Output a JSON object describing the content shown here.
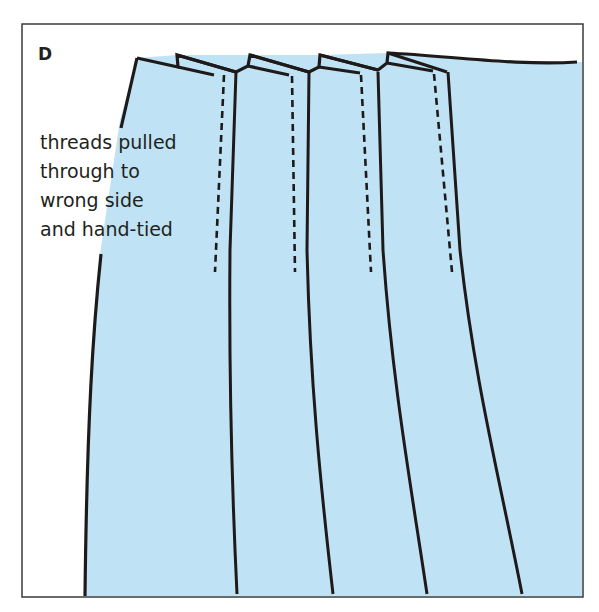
{
  "figure": {
    "panel_label": "D",
    "callout_lines": [
      "threads pulled",
      "through to",
      "wrong side",
      "and hand-tied"
    ],
    "colors": {
      "fabric": "#bfe3f5",
      "line": "#1e1a1a",
      "frame": "#3a3a3a",
      "background": "#ffffff"
    },
    "pleat_count": 4
  }
}
